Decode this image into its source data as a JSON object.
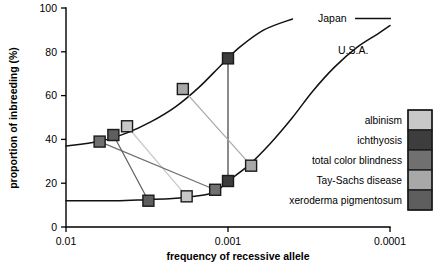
{
  "chart_data": {
    "type": "scatter",
    "title": "",
    "xlabel": "frequency of recessive allele",
    "ylabel": "proportion of inbreeding (%)",
    "xlim": [
      0.01,
      0.0001
    ],
    "ylim": [
      0,
      100
    ],
    "x_scale": "log-decreasing",
    "grid": false,
    "xticks": [
      "0.01",
      "0.001",
      "0.0001"
    ],
    "xtick_values": [
      0.01,
      0.001,
      0.0001
    ],
    "yticks": [
      "0",
      "20",
      "40",
      "60",
      "80",
      "100"
    ],
    "ytick_values": [
      0,
      20,
      40,
      60,
      80,
      100
    ],
    "legend_position": "right",
    "curves": [
      {
        "name": "Japan",
        "label": "Japan",
        "points": [
          [
            0.01,
            37
          ],
          [
            0.0063,
            39
          ],
          [
            0.0042,
            43
          ],
          [
            0.003,
            48
          ],
          [
            0.0021,
            55
          ],
          [
            0.0015,
            64
          ],
          [
            0.0011,
            74
          ],
          [
            0.00085,
            82
          ],
          [
            0.0006,
            90
          ],
          [
            0.0004,
            95
          ],
          [
            0.00025,
            96
          ],
          [
            0.0001,
            96
          ]
        ]
      },
      {
        "name": "U.S.A.",
        "label": "U.S.A.",
        "points": [
          [
            0.01,
            12
          ],
          [
            0.005,
            12
          ],
          [
            0.0032,
            12.5
          ],
          [
            0.0022,
            13
          ],
          [
            0.0016,
            14
          ],
          [
            0.0012,
            16
          ],
          [
            0.001,
            21
          ],
          [
            0.00075,
            28
          ],
          [
            0.00055,
            38
          ],
          [
            0.0004,
            50
          ],
          [
            0.0003,
            62
          ],
          [
            0.00022,
            73
          ],
          [
            0.00016,
            82
          ],
          [
            0.00012,
            88
          ],
          [
            0.0001,
            92
          ]
        ]
      }
    ],
    "series": [
      {
        "name": "albinism",
        "color": "#c8c8c8",
        "points": [
          {
            "x": 0.0042,
            "y": 46,
            "country": "Japan"
          },
          {
            "x": 0.0018,
            "y": 14,
            "country": "U.S.A."
          }
        ]
      },
      {
        "name": "ichthyosis",
        "color": "#3d3d3d",
        "points": [
          {
            "x": 0.001,
            "y": 77,
            "country": "Japan"
          },
          {
            "x": 0.001,
            "y": 21,
            "country": "U.S.A."
          }
        ]
      },
      {
        "name": "total color blindness",
        "color": "#707070",
        "points": [
          {
            "x": 0.0062,
            "y": 39,
            "country": "Japan"
          },
          {
            "x": 0.0012,
            "y": 17,
            "country": "U.S.A."
          }
        ]
      },
      {
        "name": "Tay-Sachs disease",
        "color": "#a8a8a8",
        "points": [
          {
            "x": 0.0019,
            "y": 63,
            "country": "Japan"
          },
          {
            "x": 0.00072,
            "y": 28,
            "country": "U.S.A."
          }
        ]
      },
      {
        "name": "xeroderma pigmentosum",
        "color": "#5e5e5e",
        "points": [
          {
            "x": 0.0051,
            "y": 42,
            "country": "Japan"
          },
          {
            "x": 0.0031,
            "y": 12,
            "country": "U.S.A."
          }
        ]
      }
    ]
  },
  "legend": {
    "items": [
      {
        "label": "albinism",
        "color": "#c8c8c8"
      },
      {
        "label": "ichthyosis",
        "color": "#3d3d3d"
      },
      {
        "label": "total color blindness",
        "color": "#707070"
      },
      {
        "label": "Tay-Sachs disease",
        "color": "#a8a8a8"
      },
      {
        "label": "xeroderma pigmentosum",
        "color": "#5e5e5e"
      }
    ]
  }
}
